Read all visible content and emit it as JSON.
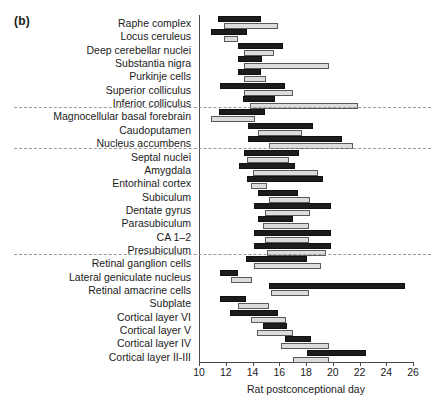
{
  "panel": {
    "label": "(b)"
  },
  "chart_data": {
    "type": "bar",
    "title": "",
    "subtitle": "",
    "xlabel": "Rat postconceptional day",
    "ylabel": "",
    "xlim": [
      10,
      26
    ],
    "xticks": [
      10,
      12,
      14,
      16,
      18,
      20,
      22,
      24,
      26
    ],
    "xticklabels": [
      "10",
      "12",
      "14",
      "16",
      "18",
      "20",
      "22",
      "24",
      "26"
    ],
    "grid": false,
    "legend": [],
    "orientation": "horizontal",
    "bar_style": {
      "dark_fill": "#1c1c1c",
      "dark_edge": "#111111",
      "light_fill": "#dcdcdc",
      "light_edge": "#5a5a5a"
    },
    "group_separators_after": [
      "Inferior colliculus",
      "Nucleus accumbens",
      "Presubiculum"
    ],
    "categories": [
      "Raphe complex",
      "Locus ceruleus",
      "Deep cerebellar nuclei",
      "Substantia nigra",
      "Purkinje cells",
      "Superior colliculus",
      "Inferior colliculus",
      "Magnocellular basal forebrain",
      "Caudoputamen",
      "Nucleus accumbens",
      "Septal nuclei",
      "Amygdala",
      "Entorhinal cortex",
      "Subiculum",
      "Dentate gyrus",
      "Parasubiculum",
      "CA 1–2",
      "Presubiculum",
      "Retinal ganglion cells",
      "Lateral geniculate nucleus",
      "Retinal amacrine cells",
      "Subplate",
      "Cortical layer VI",
      "Cortical layer V",
      "Cortical layer IV",
      "Cortical layer II-III"
    ],
    "series": [
      {
        "name": "dark",
        "spans": [
          [
            11.4,
            14.6
          ],
          [
            10.9,
            13.6
          ],
          [
            12.9,
            16.3
          ],
          [
            12.9,
            14.7
          ],
          [
            12.9,
            14.6
          ],
          [
            11.6,
            16.4
          ],
          [
            13.3,
            15.7
          ],
          [
            11.5,
            14.9
          ],
          [
            13.7,
            18.5
          ],
          [
            13.7,
            20.7
          ],
          [
            13.4,
            17.5
          ],
          [
            13.0,
            17.2
          ],
          [
            13.6,
            19.3
          ],
          [
            14.4,
            17.4
          ],
          [
            14.1,
            19.9
          ],
          [
            14.4,
            17.0
          ],
          [
            14.1,
            19.9
          ],
          [
            14.1,
            19.9
          ],
          [
            13.5,
            18.1
          ],
          [
            11.6,
            12.9
          ],
          [
            15.2,
            25.4
          ],
          [
            11.6,
            13.5
          ],
          [
            12.3,
            15.9
          ],
          [
            14.8,
            16.6
          ],
          [
            16.4,
            18.4
          ],
          [
            18.1,
            22.5
          ]
        ]
      },
      {
        "name": "light",
        "spans": [
          [
            11.9,
            15.9
          ],
          [
            11.9,
            12.9
          ],
          [
            13.4,
            15.6
          ],
          [
            13.4,
            19.7
          ],
          [
            13.4,
            15.0
          ],
          [
            13.4,
            17.0
          ],
          [
            13.8,
            21.9
          ],
          [
            10.9,
            14.2
          ],
          [
            14.4,
            17.7
          ],
          [
            15.2,
            21.5
          ],
          [
            13.6,
            16.7
          ],
          [
            14.0,
            18.9
          ],
          [
            13.9,
            15.1
          ],
          [
            15.2,
            18.3
          ],
          [
            14.9,
            18.3
          ],
          [
            14.8,
            18.2
          ],
          [
            14.9,
            18.2
          ],
          [
            15.1,
            19.5
          ],
          [
            14.1,
            19.1
          ],
          [
            12.4,
            14.0
          ],
          [
            15.4,
            18.2
          ],
          [
            12.9,
            15.2
          ],
          [
            13.9,
            16.5
          ],
          [
            14.3,
            17.0
          ],
          [
            16.1,
            19.7
          ],
          [
            17.0,
            19.7
          ]
        ]
      }
    ]
  }
}
